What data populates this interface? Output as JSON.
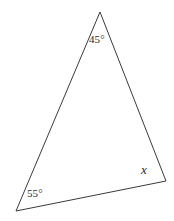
{
  "figure": {
    "kind": "geometry-diagram",
    "shape": "triangle",
    "background_color": "#ffffff",
    "stroke_color": "#3a3a3a",
    "stroke_width": 1,
    "label_color": "#2b2b2b",
    "width": 174,
    "height": 221
  },
  "geometry": {
    "vertices": [
      {
        "name": "apex",
        "x": 100,
        "y": 12
      },
      {
        "name": "bottom-right",
        "x": 166,
        "y": 181
      },
      {
        "name": "bottom-left",
        "x": 16,
        "y": 211
      }
    ],
    "polygon_points": "100,12 166,181 16,211",
    "edges": [
      {
        "name": "left-side",
        "from": "apex",
        "to": "bottom-left"
      },
      {
        "name": "right-side",
        "from": "apex",
        "to": "bottom-right"
      },
      {
        "name": "base",
        "from": "bottom-left",
        "to": "bottom-right"
      }
    ]
  },
  "labels": {
    "apex_angle": "45°",
    "bottom_left_angle": "55°",
    "bottom_right_angle": "x"
  }
}
